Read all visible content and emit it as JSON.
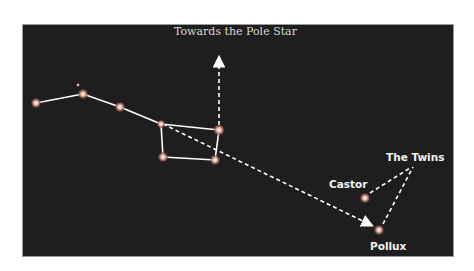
{
  "labels": {
    "pole_star": "Towards the Pole Star",
    "twins": "The Twins",
    "castor": "Castor",
    "pollux": "Pollux"
  },
  "colors": {
    "background": "#1e1e1e",
    "lines": "#ffffff",
    "star_glow": "#c97a6e",
    "star_core": "#fff6e8"
  },
  "stars": [
    {
      "name": "dipper-1",
      "x": 36,
      "y": 103
    },
    {
      "name": "alcor",
      "x": 78,
      "y": 85
    },
    {
      "name": "dipper-2",
      "x": 83,
      "y": 94
    },
    {
      "name": "dipper-3",
      "x": 120,
      "y": 107
    },
    {
      "name": "dipper-4",
      "x": 161,
      "y": 124
    },
    {
      "name": "dipper-5",
      "x": 219,
      "y": 130
    },
    {
      "name": "dipper-6",
      "x": 163,
      "y": 157
    },
    {
      "name": "dipper-7",
      "x": 215,
      "y": 160
    },
    {
      "name": "castor",
      "x": 365,
      "y": 198
    },
    {
      "name": "pollux",
      "x": 379,
      "y": 230
    }
  ]
}
